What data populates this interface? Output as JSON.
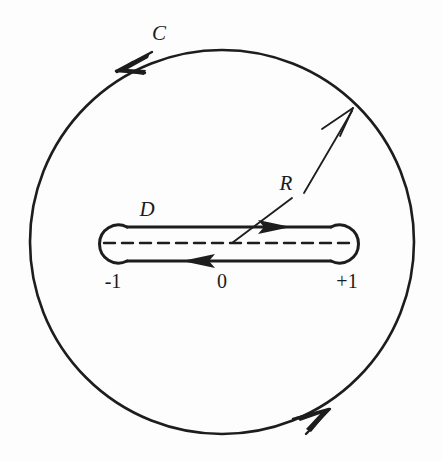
{
  "figure": {
    "background_color": "#fdfdfd",
    "ink_color": "#1d1d1d",
    "labels": {
      "outer_contour": "C",
      "inner_contour": "D",
      "radius": "R",
      "left_branch_point": "-1",
      "origin": "0",
      "right_branch_point": "+1"
    },
    "geometry": {
      "circle_center_x": 222,
      "circle_center_y": 242,
      "circle_radius": 192,
      "cut_y": 243,
      "left_lobe_x": 113,
      "right_lobe_x": 345,
      "lobe_radius": 19,
      "upper_path_y": 227,
      "lower_path_y": 261
    },
    "annotations": {
      "outer_orientation": "counterclockwise arrowheads at upper-left and lower-right of circle C",
      "inner_upper_direction": "rightward arrow on upper edge of dogbone",
      "inner_lower_direction": "leftward arrow on lower edge of dogbone",
      "branch_cut_style": "dashed segment from -1 to +1",
      "radius_arrow": "arrow from interior pointing up-right to circle boundary labelled R"
    }
  }
}
